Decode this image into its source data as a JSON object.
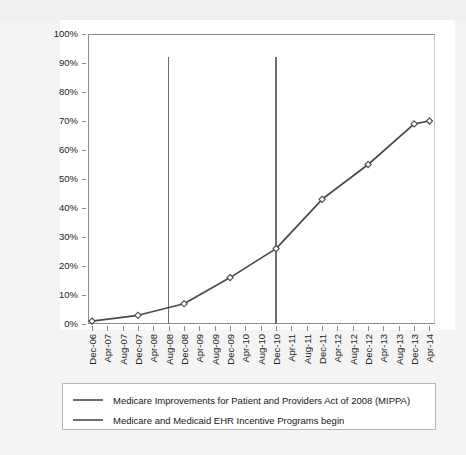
{
  "chart_data": {
    "type": "line",
    "title": "",
    "subtitle": "",
    "xlabel": "",
    "ylabel": "",
    "ylim": [
      0,
      100
    ],
    "grid": false,
    "legend_position": "bottom",
    "y_ticks": [
      "0%",
      "10%",
      "20%",
      "30%",
      "40%",
      "50%",
      "60%",
      "70%",
      "80%",
      "90%",
      "100%"
    ],
    "y_tick_values": [
      0,
      10,
      20,
      30,
      40,
      50,
      60,
      70,
      80,
      90,
      100
    ],
    "x_ticks": [
      "Dec-06",
      "Apr-07",
      "Aug-07",
      "Dec-07",
      "Apr-08",
      "Aug-08",
      "Dec-08",
      "Apr-09",
      "Aug-09",
      "Dec-09",
      "Apr-10",
      "Aug-10",
      "Dec-10",
      "Apr-11",
      "Aug-11",
      "Dec-11",
      "Apr-12",
      "Aug-12",
      "Dec-12",
      "Apr-13",
      "Aug-13",
      "Dec-13",
      "Apr-14"
    ],
    "series": [
      {
        "name": "Adoption",
        "x": [
          "Dec-06",
          "Dec-07",
          "Dec-08",
          "Dec-09",
          "Dec-10",
          "Dec-11",
          "Dec-12",
          "Dec-13",
          "Apr-14"
        ],
        "values": [
          1,
          3,
          7,
          16,
          26,
          43,
          55,
          69,
          70
        ],
        "marker": "diamond",
        "color": "#4a4a4a"
      }
    ],
    "annotations": [
      {
        "type": "vertical-line",
        "x": "Aug-08",
        "label": "Medicare Improvements for Patient and Providers Act of 2008 (MIPPA)",
        "color": "#6e6e6e",
        "top_value": 92
      },
      {
        "type": "vertical-line",
        "x": "Dec-10",
        "label": "Medicare and Medicaid EHR Incentive Programs begin",
        "color": "#6e6e6e",
        "top_value": 92
      }
    ]
  },
  "legend": {
    "entries": [
      {
        "label": "Medicare Improvements for Patient and Providers Act of 2008 (MIPPA)"
      },
      {
        "label": "Medicare and Medicaid EHR Incentive Programs begin"
      }
    ]
  },
  "caption": {
    "text": ""
  }
}
